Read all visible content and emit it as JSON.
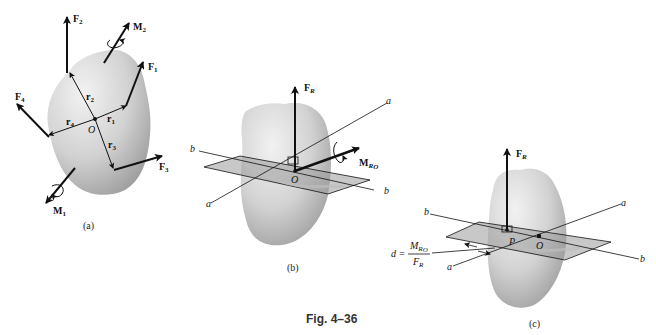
{
  "figure": {
    "title": "Fig. 4–36",
    "panels": [
      {
        "id": "a",
        "caption": "(a)",
        "point": "O",
        "forces": [
          "F1",
          "F2",
          "F3",
          "F4"
        ],
        "position_vectors": [
          "r1",
          "r2",
          "r3",
          "r4"
        ],
        "moments": [
          "M1",
          "M2"
        ]
      },
      {
        "id": "b",
        "caption": "(b)",
        "point": "O",
        "resultant_force": "FR",
        "resultant_moment": "MRO",
        "axes": [
          "a",
          "a",
          "b",
          "b"
        ]
      },
      {
        "id": "c",
        "caption": "(c)",
        "points": [
          "P",
          "O"
        ],
        "resultant_force": "FR",
        "axes": [
          "a",
          "a",
          "b",
          "b"
        ],
        "distance_formula": {
          "lhs": "d =",
          "numerator": "MRO",
          "denominator": "FR"
        }
      }
    ]
  },
  "labels": {
    "a": {
      "F1": "F",
      "F1_sub": "1",
      "F2": "F",
      "F2_sub": "2",
      "F3": "F",
      "F3_sub": "3",
      "F4": "F",
      "F4_sub": "4",
      "M1": "M",
      "M1_sub": "1",
      "M2": "M",
      "M2_sub": "2",
      "r1": "r",
      "r1_sub": "1",
      "r2": "r",
      "r2_sub": "2",
      "r3": "r",
      "r3_sub": "3",
      "r4": "r",
      "r4_sub": "4",
      "O": "O",
      "caption": "(a)"
    },
    "b": {
      "FR": "F",
      "FR_sub": "R",
      "MRO": "M",
      "MRO_sub": "R",
      "MRO_subsub": "O",
      "O": "O",
      "a_top": "a",
      "a_bottom": "a",
      "b_left": "b",
      "b_right": "b",
      "caption": "(b)"
    },
    "c": {
      "FR": "F",
      "FR_sub": "R",
      "P": "P",
      "O": "O",
      "a_top": "a",
      "a_bottom": "a",
      "b_left": "b",
      "b_right": "b",
      "d_lhs": "d =",
      "num": "M",
      "num_sub": "R",
      "num_subsub": "O",
      "den": "F",
      "den_sub": "R",
      "caption": "(c)"
    },
    "fig_title": "Fig. 4–36"
  },
  "colors": {
    "body_fill": "#d6d6d6",
    "body_shade": "#a8a8a8",
    "plane_fill": "#9a9a9a",
    "line": "#111111",
    "background": "#ffffff"
  }
}
